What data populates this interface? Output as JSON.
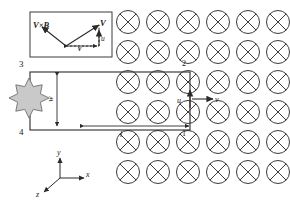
{
  "figure": {
    "background": "#ffffff",
    "line_color": "#2b2b2b",
    "field_color": "#3a3a3a",
    "load_fill": "#c9c9c9",
    "load_stroke": "#6f6f6f"
  },
  "field": {
    "symbol": "circled-cross",
    "meaning": "B into page",
    "rows": 6,
    "cols": 6,
    "x_start": 128,
    "y_start": 22,
    "dx": 30,
    "dy": 30,
    "radius": 11.5
  },
  "loop": {
    "x": 30,
    "y": 72,
    "w": 160,
    "h": 58,
    "corners": [
      {
        "id": "corner-3",
        "label": "3",
        "x": 19,
        "y": 60
      },
      {
        "id": "corner-2",
        "label": "2",
        "x": 182,
        "y": 60
      },
      {
        "id": "corner-4",
        "label": "4",
        "x": 19,
        "y": 128
      },
      {
        "id": "corner-1",
        "label": "1",
        "x": 182,
        "y": 130
      }
    ]
  },
  "dimensions": {
    "width_label": "l",
    "width_label_x": 120,
    "width_label_y": 131,
    "height_label": "w",
    "height_label_x": 48,
    "height_label_y": 95
  },
  "velocities": {
    "u": {
      "label": "u",
      "direction": "up",
      "x": 177,
      "y": 99
    },
    "v": {
      "label": "v",
      "direction": "right",
      "x": 215,
      "y": 99
    }
  },
  "inset": {
    "box": {
      "x": 30,
      "y": 12,
      "w": 82,
      "h": 45
    },
    "vectors": [
      {
        "id": "vxb",
        "label": "V×B"
      },
      {
        "id": "bigV",
        "label": "V"
      },
      {
        "id": "u",
        "label": "u"
      },
      {
        "id": "v",
        "label": "v"
      }
    ],
    "labels": {
      "vxb": {
        "text": "V×B",
        "x": 33,
        "y": 22
      },
      "bigV": {
        "text": "V",
        "x": 100,
        "y": 22
      },
      "u": {
        "text": "u",
        "x": 101,
        "y": 38
      },
      "v": {
        "text": "v",
        "x": 70,
        "y": 48
      }
    }
  },
  "axes": {
    "origin_x": 60,
    "origin_y": 178,
    "items": [
      {
        "id": "axis-y",
        "label": "y",
        "x": 58,
        "y": 152
      },
      {
        "id": "axis-x",
        "label": "x",
        "x": 88,
        "y": 174
      },
      {
        "id": "axis-z",
        "label": "z",
        "x": 36,
        "y": 195
      }
    ]
  }
}
